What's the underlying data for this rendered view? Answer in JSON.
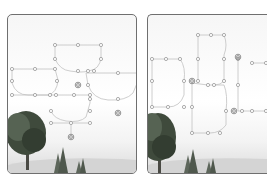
{
  "figure": {
    "panels": [
      {
        "id": "left",
        "label": ""
      },
      {
        "id": "right",
        "label": ""
      }
    ],
    "colors": {
      "border": "#6f6f6f",
      "control_point": "#9a9a9a",
      "curve": "#b5b5b5",
      "tree": "#3d4a3a",
      "ground": "#cfcfcf"
    }
  }
}
